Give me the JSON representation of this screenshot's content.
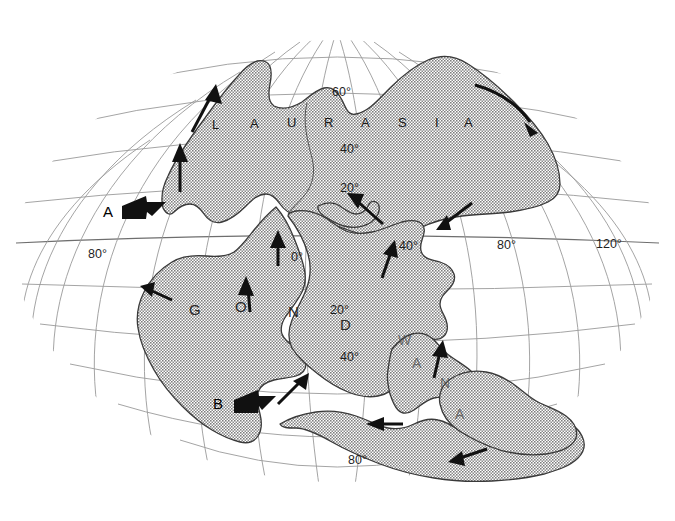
{
  "map": {
    "title_supercontinent_north": "LAURASIA",
    "title_supercontinent_south": "GONDWANA",
    "ocean_color": "#ffffff",
    "land_color": "#9b9b9b",
    "graticule_color": "#9a9a9a",
    "arrow_color": "#111111",
    "projection": "oval-pseudocylindrical",
    "north_name_letters": [
      {
        "char": "L",
        "x": 212,
        "y": 129
      },
      {
        "char": "A",
        "x": 250,
        "y": 128
      },
      {
        "char": "U",
        "x": 287,
        "y": 127
      },
      {
        "char": "R",
        "x": 324,
        "y": 127
      },
      {
        "char": "A",
        "x": 361,
        "y": 127
      },
      {
        "char": "S",
        "x": 398,
        "y": 127
      },
      {
        "char": "I",
        "x": 435,
        "y": 127
      },
      {
        "char": "A",
        "x": 464,
        "y": 127
      }
    ],
    "south_name_letters": [
      {
        "char": "G",
        "x": 189,
        "y": 315,
        "faint": false
      },
      {
        "char": "O",
        "x": 235,
        "y": 312,
        "faint": false
      },
      {
        "char": "N",
        "x": 288,
        "y": 317,
        "faint": false
      },
      {
        "char": "D",
        "x": 340,
        "y": 330,
        "faint": false
      },
      {
        "char": "W",
        "x": 398,
        "y": 345,
        "faint": true
      },
      {
        "char": "A",
        "x": 412,
        "y": 368,
        "faint": true
      },
      {
        "char": "N",
        "x": 440,
        "y": 388,
        "faint": true
      },
      {
        "char": "A",
        "x": 455,
        "y": 419,
        "faint": true
      }
    ],
    "graticule_labels": [
      {
        "text": "60°",
        "x": 332,
        "y": 96
      },
      {
        "text": "40°",
        "x": 340,
        "y": 153
      },
      {
        "text": "20°",
        "x": 340,
        "y": 192
      },
      {
        "text": "0°",
        "x": 291,
        "y": 261
      },
      {
        "text": "40°",
        "x": 399,
        "y": 250
      },
      {
        "text": "80°",
        "x": 497,
        "y": 249
      },
      {
        "text": "120°",
        "x": 596,
        "y": 248
      },
      {
        "text": "80°",
        "x": 88,
        "y": 258
      },
      {
        "text": "20°",
        "x": 330,
        "y": 314
      },
      {
        "text": "40°",
        "x": 340,
        "y": 361
      },
      {
        "text": "80°",
        "x": 348,
        "y": 464
      }
    ],
    "plate_motion_markers": [
      {
        "label": "A",
        "x": 108,
        "y": 212,
        "description": "thick-arrow-marker-a"
      },
      {
        "label": "B",
        "x": 218,
        "y": 404,
        "description": "thick-arrow-marker-b"
      }
    ],
    "arrows": [
      {
        "name": "arrow-laurasia-nw",
        "direction": "north-northeast"
      },
      {
        "name": "arrow-laurasia-west",
        "direction": "north"
      },
      {
        "name": "arrow-laurasia-ne-curved",
        "direction": "southeast"
      },
      {
        "name": "arrow-tethys-north",
        "direction": "northwest"
      },
      {
        "name": "arrow-tethys-east",
        "direction": "southwest"
      },
      {
        "name": "arrow-africa-north",
        "direction": "north"
      },
      {
        "name": "arrow-india-north",
        "direction": "northeast"
      },
      {
        "name": "arrow-gondwana-west",
        "direction": "northwest"
      },
      {
        "name": "arrow-gondwana-central",
        "direction": "north"
      },
      {
        "name": "arrow-gondwana-southeast",
        "direction": "northeast"
      },
      {
        "name": "arrow-australia-north",
        "direction": "north"
      },
      {
        "name": "arrow-antarctica-west",
        "direction": "west"
      },
      {
        "name": "arrow-antarctica-southwest",
        "direction": "west-southwest"
      }
    ]
  }
}
